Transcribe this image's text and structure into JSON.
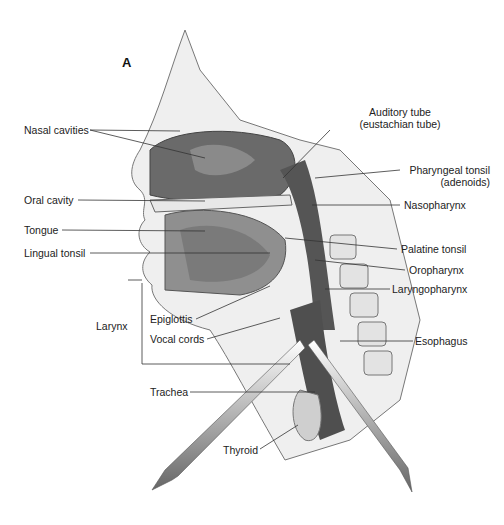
{
  "panel_letter": "A",
  "labels": {
    "nasal_cavities": "Nasal cavities",
    "oral_cavity": "Oral cavity",
    "tongue": "Tongue",
    "lingual_tonsil": "Lingual tonsil",
    "larynx": "Larynx",
    "epiglottis": "Epiglottis",
    "vocal_cords": "Vocal cords",
    "trachea": "Trachea",
    "thyroid": "Thyroid",
    "auditory_tube_1": "Auditory tube",
    "auditory_tube_2": "(eustachian tube)",
    "pharyngeal_tonsil_1": "Pharyngeal tonsil",
    "pharyngeal_tonsil_2": "(adenoids)",
    "nasopharynx": "Nasopharynx",
    "palatine_tonsil": "Palatine tonsil",
    "oropharynx": "Oropharynx",
    "laryngopharynx": "Laryngopharynx",
    "esophagus": "Esophagus"
  },
  "colors": {
    "tissue_dark": "#5a5a5a",
    "tissue_mid": "#8c8c8c",
    "tissue_light": "#c8c8c8",
    "bone": "#e6e6e6",
    "line": "#333333"
  }
}
